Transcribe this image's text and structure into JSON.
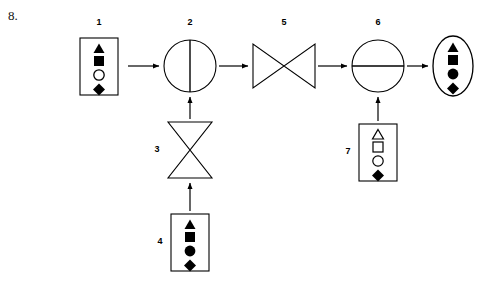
{
  "page": {
    "item_number": "8.",
    "background_color": "#ffffff",
    "stroke_color": "#000000",
    "fill_color": "#000000",
    "width": 486,
    "height": 281
  },
  "diagram": {
    "type": "process-flow-puzzle",
    "nodes": [
      {
        "id": "node-1",
        "label": "1",
        "label_position": "above",
        "shape": "rectangle",
        "role": "input",
        "x": 80,
        "y": 38,
        "w": 38,
        "h": 57,
        "label_x": 99,
        "label_y": 23,
        "contents": [
          {
            "glyph": "triangle",
            "fill": "solid"
          },
          {
            "glyph": "square",
            "fill": "solid"
          },
          {
            "glyph": "circle",
            "fill": "open"
          },
          {
            "glyph": "diamond",
            "fill": "solid"
          }
        ]
      },
      {
        "id": "node-2",
        "label": "2",
        "label_position": "above",
        "shape": "circle-vertical-bar",
        "role": "operator",
        "cx": 190,
        "cy": 66,
        "r": 26,
        "label_x": 190,
        "label_y": 23,
        "contents": []
      },
      {
        "id": "node-3",
        "label": "3",
        "label_position": "left",
        "shape": "hourglass-vertical",
        "role": "operator",
        "x": 168,
        "y": 122,
        "w": 44,
        "h": 56,
        "label_x": 157,
        "label_y": 150,
        "contents": []
      },
      {
        "id": "node-4",
        "label": "4",
        "label_position": "left",
        "shape": "rectangle",
        "role": "input",
        "x": 171,
        "y": 214,
        "w": 38,
        "h": 57,
        "label_x": 160,
        "label_y": 242,
        "contents": [
          {
            "glyph": "triangle",
            "fill": "solid"
          },
          {
            "glyph": "square",
            "fill": "solid"
          },
          {
            "glyph": "circle",
            "fill": "solid"
          },
          {
            "glyph": "diamond",
            "fill": "solid"
          }
        ]
      },
      {
        "id": "node-5",
        "label": "5",
        "label_position": "above",
        "shape": "hourglass-horizontal",
        "role": "operator",
        "x": 253,
        "y": 44,
        "w": 62,
        "h": 44,
        "label_x": 284,
        "label_y": 23,
        "contents": []
      },
      {
        "id": "node-6",
        "label": "6",
        "label_position": "above",
        "shape": "circle-horizontal-bar",
        "role": "operator",
        "cx": 378,
        "cy": 66,
        "r": 26,
        "label_x": 378,
        "label_y": 23,
        "contents": []
      },
      {
        "id": "node-7",
        "label": "7",
        "label_position": "left",
        "shape": "rectangle",
        "role": "input",
        "x": 359,
        "y": 124,
        "w": 38,
        "h": 57,
        "label_x": 348,
        "label_y": 152,
        "contents": [
          {
            "glyph": "triangle",
            "fill": "open"
          },
          {
            "glyph": "square",
            "fill": "open"
          },
          {
            "glyph": "circle",
            "fill": "open"
          },
          {
            "glyph": "diamond",
            "fill": "solid"
          }
        ]
      },
      {
        "id": "node-output",
        "label": "",
        "label_position": "none",
        "shape": "ellipse",
        "role": "output",
        "cx": 453,
        "cy": 66,
        "rx": 20,
        "ry": 30,
        "contents": [
          {
            "glyph": "triangle",
            "fill": "solid"
          },
          {
            "glyph": "square",
            "fill": "solid"
          },
          {
            "glyph": "circle",
            "fill": "solid"
          },
          {
            "glyph": "diamond",
            "fill": "solid"
          }
        ]
      }
    ],
    "arrows": [
      {
        "id": "arrow-1-to-2",
        "from": "node-1",
        "to": "node-2",
        "direction": "right",
        "x1": 128,
        "y1": 66,
        "x2": 161,
        "y2": 66
      },
      {
        "id": "arrow-2-to-5",
        "from": "node-2",
        "to": "node-5",
        "direction": "right",
        "x1": 219,
        "y1": 66,
        "x2": 250,
        "y2": 66
      },
      {
        "id": "arrow-5-to-6",
        "from": "node-5",
        "to": "node-6",
        "direction": "right",
        "x1": 318,
        "y1": 66,
        "x2": 349,
        "y2": 66
      },
      {
        "id": "arrow-6-to-output",
        "from": "node-6",
        "to": "node-output",
        "direction": "right",
        "x1": 407,
        "y1": 66,
        "x2": 430,
        "y2": 66
      },
      {
        "id": "arrow-3-to-2",
        "from": "node-3",
        "to": "node-2",
        "direction": "up",
        "x1": 190,
        "y1": 119,
        "x2": 190,
        "y2": 95
      },
      {
        "id": "arrow-4-to-3",
        "from": "node-4",
        "to": "node-3",
        "direction": "up",
        "x1": 190,
        "y1": 211,
        "x2": 190,
        "y2": 181
      },
      {
        "id": "arrow-7-to-6",
        "from": "node-7",
        "to": "node-6",
        "direction": "up",
        "x1": 378,
        "y1": 121,
        "x2": 378,
        "y2": 95
      }
    ]
  }
}
